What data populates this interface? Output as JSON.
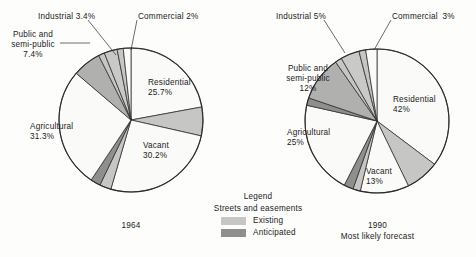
{
  "colors": {
    "background": "#fdfdfc",
    "outline": "#2b2b2b",
    "text": "#1a1a1a",
    "white_slice": "#fafaf8",
    "light_gray": "#c9c9c7",
    "mid_gray": "#b0b0ae",
    "dark_gray": "#8d8d8b",
    "existing_streets": "#c6c6c4",
    "anticipated_streets": "#8f8f8d"
  },
  "legend": {
    "title": "Legend",
    "subtitle": "Streets and easements",
    "items": [
      {
        "label": "Existing",
        "color": "#c6c6c4",
        "swatch_name": "legend-swatch-existing"
      },
      {
        "label": "Anticipated",
        "color": "#8f8f8d",
        "swatch_name": "legend-swatch-anticipated"
      }
    ]
  },
  "chart_data": {
    "type": "pie",
    "title": "",
    "legend_position": "bottom-center",
    "charts": [
      {
        "id": "left",
        "caption": "1964",
        "caption_lines": [
          "1964"
        ],
        "center": [
          131,
          120
        ],
        "radius": 72,
        "start_angle_deg": -90,
        "labels": {
          "industrial": {
            "text": "Industrial 3.4%",
            "x": 38,
            "y": 12,
            "align": "left"
          },
          "commercial": {
            "text": "Commercial 2%",
            "x": 138,
            "y": 12,
            "align": "left"
          },
          "public": {
            "text": "Public and\nsemi-public\n7.4%",
            "x": 6,
            "y": 34,
            "align": "center"
          },
          "residential": {
            "text": "Residential\n25.7%",
            "x": 148,
            "y": 78,
            "align": "left"
          },
          "vacant": {
            "text": "Vacant\n30.2%",
            "x": 143,
            "y": 141,
            "align": "left"
          },
          "agricultural": {
            "text": "Agricultural\n31.3%",
            "x": 30,
            "y": 122,
            "align": "left"
          }
        },
        "slices": [
          {
            "name": "Residential",
            "label": "Residential",
            "value": 25.7,
            "display": "25.7%",
            "color": "#fafaf8"
          },
          {
            "name": "Streets existing A",
            "label": "Existing",
            "value": 7.5,
            "display": "",
            "color": "#c6c6c4"
          },
          {
            "name": "Vacant",
            "label": "Vacant",
            "value": 30.2,
            "display": "30.2%",
            "color": "#fafaf8"
          },
          {
            "name": "Streets existing B",
            "label": "Existing",
            "value": 3.0,
            "display": "",
            "color": "#c6c6c4"
          },
          {
            "name": "Streets anticipated",
            "label": "Anticipated",
            "value": 2.6,
            "display": "",
            "color": "#8f8f8d"
          },
          {
            "name": "Agricultural",
            "label": "Agricultural",
            "value": 31.3,
            "display": "31.3%",
            "color": "#fafaf8"
          },
          {
            "name": "Public and semi-public",
            "label": "Public and semi-public",
            "value": 7.4,
            "display": "7.4%",
            "color": "#b0b0ae"
          },
          {
            "name": "Streets existing C",
            "label": "Existing",
            "value": 1.6,
            "display": "",
            "color": "#c6c6c4"
          },
          {
            "name": "Industrial",
            "label": "Industrial",
            "value": 3.4,
            "display": "3.4%",
            "color": "#c9c9c7"
          },
          {
            "name": "Streets existing D",
            "label": "Existing",
            "value": 1.6,
            "display": "",
            "color": "#c6c6c4"
          },
          {
            "name": "Commercial",
            "label": "Commercial",
            "value": 2.0,
            "display": "2%",
            "color": "#fafaf8"
          }
        ]
      },
      {
        "id": "right",
        "caption": "1990\nMost likely forecast",
        "caption_lines": [
          "1990",
          "Most likely forecast"
        ],
        "center": [
          377,
          121
        ],
        "radius": 72,
        "start_angle_deg": -90,
        "labels": {
          "industrial": {
            "text": "Industrial 5%",
            "x": 276,
            "y": 12,
            "align": "left"
          },
          "commercial": {
            "text": "Commercial  3%",
            "x": 392,
            "y": 12,
            "align": "left"
          },
          "public": {
            "text": "Public and\nsemi-public\n12%",
            "x": 279,
            "y": 68,
            "align": "center"
          },
          "residential": {
            "text": "Residential\n42%",
            "x": 393,
            "y": 95,
            "align": "left"
          },
          "vacant": {
            "text": "Vacant\n13%",
            "x": 366,
            "y": 167,
            "align": "left"
          },
          "agricultural": {
            "text": "Agricultural\n25%",
            "x": 287,
            "y": 128,
            "align": "left"
          }
        },
        "slices": [
          {
            "name": "Residential",
            "label": "Residential",
            "value": 42.0,
            "display": "42%",
            "color": "#fafaf8"
          },
          {
            "name": "Streets existing A",
            "label": "Existing",
            "value": 9.0,
            "display": "",
            "color": "#c6c6c4"
          },
          {
            "name": "Vacant",
            "label": "Vacant",
            "value": 13.0,
            "display": "13%",
            "color": "#fafaf8"
          },
          {
            "name": "Streets existing B",
            "label": "Existing",
            "value": 2.0,
            "display": "",
            "color": "#c6c6c4"
          },
          {
            "name": "Streets anticipated",
            "label": "Anticipated",
            "value": 2.5,
            "display": "",
            "color": "#8f8f8d"
          },
          {
            "name": "Agricultural",
            "label": "Agricultural",
            "value": 25.0,
            "display": "25%",
            "color": "#fafaf8"
          },
          {
            "name": "Streets anticipated B",
            "label": "Anticipated",
            "value": 2.0,
            "display": "",
            "color": "#8f8f8d"
          },
          {
            "name": "Public and semi-public",
            "label": "Public and semi-public",
            "value": 12.0,
            "display": "12%",
            "color": "#b0b0ae"
          },
          {
            "name": "Streets existing C",
            "label": "Existing",
            "value": 1.8,
            "display": "",
            "color": "#c6c6c4"
          },
          {
            "name": "Industrial",
            "label": "Industrial",
            "value": 5.0,
            "display": "5%",
            "color": "#c9c9c7"
          },
          {
            "name": "Streets existing D",
            "label": "Existing",
            "value": 1.8,
            "display": "",
            "color": "#c6c6c4"
          },
          {
            "name": "Commercial",
            "label": "Commercial",
            "value": 3.0,
            "display": "3%",
            "color": "#fafaf8"
          }
        ]
      }
    ],
    "leaders": [
      {
        "chart": "left",
        "name": "leader-industrial",
        "x1": 88,
        "y1": 20,
        "x2": 116,
        "y2": 55
      },
      {
        "chart": "left",
        "name": "leader-commercial",
        "x1": 137,
        "y1": 20,
        "x2": 131,
        "y2": 50
      },
      {
        "chart": "left",
        "name": "leader-public",
        "x1": 60,
        "y1": 43,
        "x2": 90,
        "y2": 43
      },
      {
        "chart": "right",
        "name": "leader-industrial",
        "x1": 324,
        "y1": 20,
        "x2": 345,
        "y2": 53
      },
      {
        "chart": "right",
        "name": "leader-commercial",
        "x1": 391,
        "y1": 20,
        "x2": 374,
        "y2": 50
      }
    ]
  }
}
